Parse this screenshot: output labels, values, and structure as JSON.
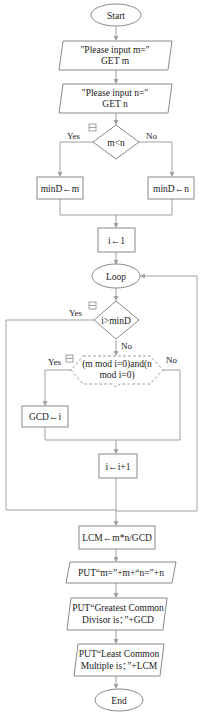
{
  "flowchart": {
    "start": "Start",
    "input_m": {
      "line1": "\"Please input m=\"",
      "line2": "GET m"
    },
    "input_n": {
      "line1": "\"Please input n=\"",
      "line2": "GET n"
    },
    "decision_mn": {
      "label": "m<n",
      "yes": "Yes",
      "no": "No"
    },
    "assign_min_m": "minD←m",
    "assign_min_n": "minD←n",
    "init_i": "i←1",
    "loop": "Loop",
    "decision_i": {
      "label": "i>minD",
      "yes": "Yes",
      "no": "No"
    },
    "decision_mod": {
      "line1": "(m mod i=0)and(n",
      "line2": "mod i=0)",
      "yes": "Yes",
      "no": "No"
    },
    "assign_gcd": "GCD←i",
    "increment_i": "i←i+1",
    "assign_lcm": "LCM←m*n/GCD",
    "put_mn": "PUT“m=”+m+“n=”+n",
    "put_gcd": {
      "line1": "PUT“Greatest Common",
      "line2": "Divisor is：”+GCD"
    },
    "put_lcm": {
      "line1": "PUT“Least Common",
      "line2": "Multiple is：”+LCM"
    },
    "end": "End",
    "collapse_icon": "minus-box-icon"
  }
}
